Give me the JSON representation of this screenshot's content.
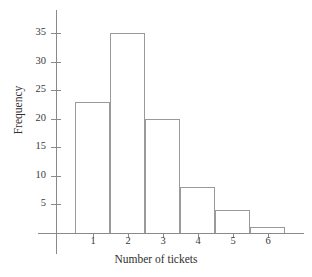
{
  "chart_data": {
    "type": "bar",
    "title": "",
    "subtitle": "",
    "xlabel": "Number of tickets",
    "ylabel": "Frequency",
    "categories": [
      "1",
      "2",
      "3",
      "4",
      "5",
      "6"
    ],
    "values": [
      23,
      35,
      20,
      8,
      4,
      1
    ],
    "series": [
      {
        "name": "Frequency",
        "values": [
          23,
          35,
          20,
          8,
          4,
          1
        ]
      }
    ],
    "xlim": [
      0.5,
      6.5
    ],
    "ylim": [
      0,
      37
    ],
    "yticks": [
      5,
      10,
      15,
      20,
      25,
      30,
      35
    ],
    "ytick_labels": [
      "5",
      "10",
      "15",
      "20",
      "25",
      "30",
      "35"
    ],
    "xticks": [
      1,
      2,
      3,
      4,
      5,
      6
    ],
    "xtick_labels": [
      "1",
      "2",
      "3",
      "4",
      "5",
      "6"
    ],
    "grid": false,
    "legend": false,
    "legend_position": "none",
    "annotations": [],
    "colors": {
      "bar_fill": "#ffffff",
      "bar_edge": "#9a9a9a",
      "axis": "#8a8a8a",
      "text": "#2f2f2f",
      "background": "#ffffff"
    }
  }
}
